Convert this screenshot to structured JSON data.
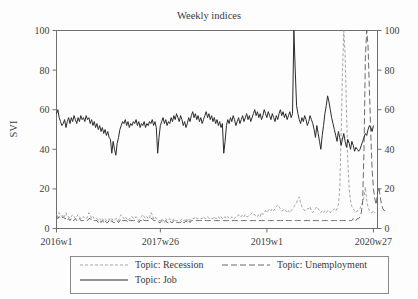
{
  "chart_data": {
    "type": "line",
    "title": "Weekly indices",
    "xlabel": "",
    "ylabel": "SVI",
    "ylim": [
      0,
      100
    ],
    "yticks": [
      0,
      20,
      40,
      60,
      80,
      100
    ],
    "ytick_labels": [
      "0",
      "20",
      "40",
      "60",
      "80",
      "100"
    ],
    "right_axis": true,
    "right_ytick_labels": [
      "0",
      "20",
      "40",
      "60",
      "80",
      "100"
    ],
    "xtick_labels": [
      "2016w1",
      "2017w26",
      "2019w1",
      "2020w27"
    ],
    "xtick_positions": [
      0,
      77,
      156,
      235
    ],
    "xlim": [
      0,
      238
    ],
    "grid": false,
    "legend_position": "bottom",
    "series": [
      {
        "name": "Topic: Recession",
        "legend_label": "Topic: Recession",
        "color": "#9a9a9a",
        "dash": "3,2",
        "width": 0.9,
        "values": [
          7,
          6,
          8,
          7,
          6,
          7,
          6,
          8,
          6,
          6,
          5,
          6,
          7,
          6,
          5,
          6,
          7,
          6,
          5,
          5,
          6,
          5,
          5,
          6,
          8,
          7,
          5,
          6,
          5,
          5,
          5,
          4,
          5,
          4,
          5,
          4,
          5,
          4,
          4,
          5,
          4,
          5,
          4,
          4,
          5,
          5,
          4,
          6,
          7,
          6,
          5,
          6,
          5,
          4,
          5,
          5,
          6,
          5,
          5,
          6,
          5,
          4,
          5,
          6,
          7,
          6,
          5,
          6,
          5,
          5,
          8,
          7,
          5,
          6,
          5,
          5,
          4,
          4,
          5,
          4,
          4,
          5,
          4,
          4,
          5,
          4,
          4,
          5,
          4,
          4,
          4,
          4,
          4,
          5,
          4,
          4,
          5,
          4,
          5,
          4,
          5,
          5,
          5,
          6,
          5,
          5,
          5,
          5,
          5,
          6,
          5,
          5,
          6,
          5,
          5,
          5,
          5,
          6,
          5,
          5,
          6,
          5,
          6,
          5,
          5,
          6,
          5,
          6,
          5,
          5,
          6,
          5,
          5,
          6,
          6,
          7,
          6,
          6,
          7,
          6,
          7,
          6,
          6,
          7,
          7,
          8,
          7,
          7,
          6,
          6,
          7,
          6,
          8,
          7,
          8,
          9,
          8,
          9,
          10,
          9,
          10,
          9,
          10,
          11,
          12,
          11,
          10,
          9,
          9,
          10,
          9,
          8,
          9,
          8,
          9,
          10,
          11,
          12,
          13,
          15,
          16,
          13,
          11,
          10,
          9,
          9,
          10,
          10,
          11,
          9,
          8,
          9,
          10,
          11,
          10,
          9,
          8,
          9,
          8,
          9,
          8,
          9,
          9,
          8,
          9,
          9,
          10,
          9,
          10,
          12,
          20,
          46,
          78,
          100,
          88,
          60,
          34,
          20,
          14,
          11,
          10,
          9,
          8,
          9,
          9,
          10,
          12,
          13,
          16,
          21,
          14,
          11,
          9,
          8,
          8,
          9,
          8
        ],
        "peak": 100,
        "peak_label": "2020 spike"
      },
      {
        "name": "Topic: Unemployment",
        "legend_label": "Topic: Unemployment",
        "color": "#5a5a5a",
        "dash": "6,3",
        "width": 0.9,
        "values": [
          6,
          5,
          6,
          5,
          5,
          6,
          5,
          5,
          4,
          5,
          4,
          5,
          4,
          4,
          5,
          4,
          4,
          5,
          4,
          4,
          4,
          4,
          4,
          4,
          5,
          5,
          4,
          4,
          4,
          4,
          4,
          3,
          4,
          3,
          4,
          3,
          4,
          3,
          3,
          4,
          3,
          4,
          3,
          3,
          4,
          4,
          3,
          4,
          5,
          4,
          4,
          4,
          4,
          3,
          4,
          4,
          4,
          4,
          4,
          4,
          4,
          3,
          4,
          4,
          5,
          4,
          4,
          4,
          4,
          4,
          5,
          5,
          4,
          4,
          4,
          4,
          3,
          3,
          4,
          3,
          3,
          4,
          3,
          3,
          4,
          3,
          3,
          4,
          3,
          3,
          3,
          3,
          3,
          4,
          3,
          3,
          4,
          3,
          4,
          3,
          4,
          4,
          4,
          4,
          4,
          4,
          4,
          4,
          4,
          4,
          4,
          4,
          4,
          4,
          4,
          4,
          4,
          4,
          4,
          4,
          4,
          4,
          4,
          4,
          4,
          4,
          4,
          4,
          4,
          4,
          4,
          4,
          4,
          4,
          4,
          4,
          4,
          4,
          4,
          4,
          4,
          4,
          4,
          4,
          4,
          4,
          4,
          4,
          4,
          4,
          4,
          4,
          4,
          4,
          4,
          4,
          4,
          4,
          4,
          4,
          4,
          4,
          4,
          4,
          4,
          4,
          4,
          4,
          4,
          4,
          4,
          4,
          4,
          4,
          4,
          4,
          4,
          4,
          4,
          4,
          4,
          4,
          4,
          4,
          4,
          4,
          4,
          4,
          4,
          4,
          4,
          4,
          4,
          4,
          4,
          4,
          4,
          4,
          4,
          4,
          4,
          4,
          4,
          4,
          4,
          4,
          4,
          4,
          4,
          4,
          4,
          4,
          4,
          4,
          4,
          4,
          4,
          4,
          4,
          4,
          5,
          4,
          4,
          5,
          5,
          6,
          8,
          14,
          40,
          86,
          100,
          92,
          70,
          48,
          30,
          20,
          15,
          12,
          18,
          21,
          16,
          12,
          10,
          9,
          9,
          8
        ],
        "peak": 100
      },
      {
        "name": "Topic: Job",
        "legend_label": "Topic: Job",
        "color": "#2b2b2b",
        "dash": "0",
        "width": 1.0,
        "values": [
          58,
          60,
          56,
          54,
          52,
          53,
          55,
          51,
          54,
          56,
          53,
          56,
          54,
          57,
          55,
          53,
          56,
          54,
          57,
          55,
          56,
          54,
          57,
          55,
          56,
          53,
          55,
          52,
          54,
          51,
          53,
          50,
          52,
          49,
          51,
          48,
          50,
          47,
          49,
          46,
          45,
          38,
          44,
          40,
          37,
          43,
          46,
          50,
          52,
          54,
          53,
          55,
          52,
          54,
          51,
          53,
          52,
          54,
          53,
          55,
          52,
          54,
          51,
          53,
          52,
          54,
          51,
          53,
          52,
          54,
          53,
          55,
          52,
          54,
          51,
          38,
          46,
          52,
          54,
          56,
          53,
          55,
          52,
          54,
          53,
          56,
          54,
          57,
          55,
          58,
          56,
          54,
          57,
          55,
          52,
          54,
          51,
          53,
          56,
          54,
          57,
          59,
          56,
          58,
          55,
          57,
          54,
          56,
          53,
          55,
          57,
          59,
          56,
          58,
          55,
          57,
          54,
          56,
          53,
          55,
          52,
          54,
          51,
          53,
          38,
          44,
          52,
          55,
          53,
          56,
          54,
          57,
          55,
          52,
          54,
          56,
          53,
          55,
          57,
          54,
          56,
          58,
          55,
          57,
          54,
          56,
          58,
          60,
          57,
          59,
          56,
          58,
          55,
          57,
          60,
          58,
          56,
          59,
          57,
          55,
          58,
          56,
          54,
          57,
          55,
          58,
          60,
          57,
          59,
          56,
          58,
          55,
          57,
          59,
          56,
          58,
          100,
          80,
          62,
          58,
          55,
          53,
          56,
          54,
          57,
          55,
          52,
          54,
          57,
          55,
          53,
          50,
          46,
          52,
          48,
          44,
          40,
          47,
          52,
          58,
          62,
          67,
          64,
          60,
          56,
          53,
          50,
          47,
          44,
          49,
          46,
          42,
          45,
          48,
          44,
          41,
          45,
          43,
          40,
          44,
          42,
          39,
          41,
          40,
          39,
          40,
          42,
          44,
          46,
          48,
          47,
          50,
          52,
          51,
          49,
          52
        ],
        "peak": 100
      }
    ]
  },
  "legend": {
    "entries": [
      {
        "label": "Topic: Recession"
      },
      {
        "label": "Topic: Unemployment"
      },
      {
        "label": "Topic: Job"
      }
    ]
  }
}
